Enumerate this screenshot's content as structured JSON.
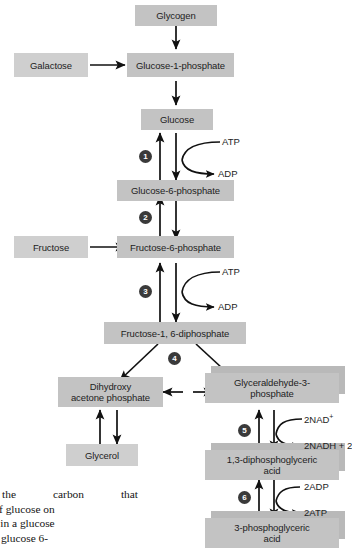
{
  "diagram": {
    "colors": {
      "node_fill": "#c3c3c3",
      "node_fill_light": "#cfcfcf",
      "node_shadow": "#b9b9b9",
      "step_circle": "#3a3a3a",
      "step_number_text": "#ffffff",
      "arrow": "#111111",
      "text": "#1d1d1d",
      "background": "#ffffff"
    },
    "nodes": [
      {
        "id": "glycogen",
        "label": "Glycogen"
      },
      {
        "id": "galactose",
        "label": "Galactose"
      },
      {
        "id": "glucose-1-phosphate",
        "label": "Glucose-1-phosphate"
      },
      {
        "id": "glucose",
        "label": "Glucose"
      },
      {
        "id": "glucose-6-phosphate",
        "label": "Glucose-6-phosphate"
      },
      {
        "id": "fructose",
        "label": "Fructose"
      },
      {
        "id": "fructose-6-phosphate",
        "label": "Fructose-6-phosphate"
      },
      {
        "id": "fructose-1-6-diphosphate",
        "label": "Fructose-1, 6-diphosphate"
      },
      {
        "id": "dihydroxyacetone-phosphate",
        "label": "Dihydroxy\nacetone phosphate"
      },
      {
        "id": "glyceraldehyde-3-phosphate",
        "label": "Glyceraldehyde-3-\nphosphate"
      },
      {
        "id": "glycerol",
        "label": "Glycerol"
      },
      {
        "id": "1-3-diphosphoglyceric-acid",
        "label": "1,3-diphosphoglyceric\nacid"
      },
      {
        "id": "3-phosphoglyceric-acid",
        "label": "3-phosphoglyceric\nacid"
      }
    ],
    "steps": [
      {
        "number": "1",
        "label": "1"
      },
      {
        "number": "2",
        "label": "2"
      },
      {
        "number": "3",
        "label": "3"
      },
      {
        "number": "4",
        "label": "4"
      },
      {
        "number": "5",
        "label": "5"
      },
      {
        "number": "6",
        "label": "6"
      }
    ],
    "cofactors": [
      {
        "id": "atp-1",
        "label": "ATP"
      },
      {
        "id": "adp-1",
        "label": "ADP"
      },
      {
        "id": "atp-2",
        "label": "ATP"
      },
      {
        "id": "adp-2",
        "label": "ADP"
      },
      {
        "id": "nad-plus",
        "label": "2NAD",
        "superscript": "+"
      },
      {
        "id": "nadh",
        "label": "2NADH + 2"
      },
      {
        "id": "adp-3",
        "label": "2ADP"
      },
      {
        "id": "atp-3",
        "label": "2ATP"
      }
    ]
  },
  "caption": {
    "lines": [
      "t  the  carbon  that",
      "agram of glucose on",
      "carbons in a glucose"
    ],
    "line4_partial": "as such, glucose 6-"
  }
}
